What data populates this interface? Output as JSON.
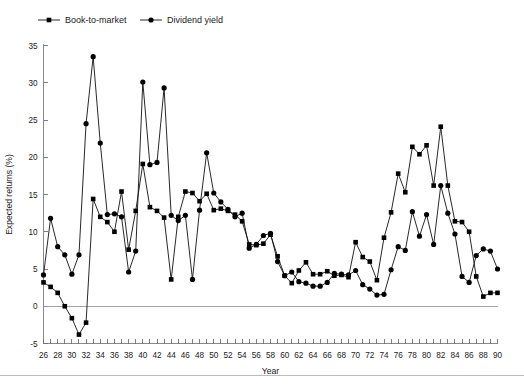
{
  "chart_data": {
    "type": "line",
    "title": "",
    "xlabel": "Year",
    "ylabel": "Expected returns (%)",
    "xlim": [
      26,
      90
    ],
    "ylim": [
      -5,
      35
    ],
    "grid": false,
    "legend_position": "top-left",
    "x_tick_step_major": 2,
    "x_tick_step_minor": 1,
    "y_tick_step": 5,
    "x_tick_labels": [
      "26",
      "28",
      "30",
      "32",
      "34",
      "36",
      "38",
      "40",
      "42",
      "44",
      "46",
      "48",
      "50",
      "52",
      "54",
      "56",
      "58",
      "60",
      "62",
      "64",
      "66",
      "68",
      "70",
      "72",
      "74",
      "76",
      "78",
      "80",
      "82",
      "84",
      "86",
      "88",
      "90"
    ],
    "y_tick_labels": [
      "-5",
      "0",
      "5",
      "10",
      "15",
      "20",
      "25",
      "30",
      "35"
    ],
    "x": [
      26,
      27,
      28,
      29,
      30,
      31,
      32,
      33,
      34,
      35,
      36,
      37,
      38,
      39,
      40,
      41,
      42,
      43,
      44,
      45,
      46,
      47,
      48,
      49,
      50,
      51,
      52,
      53,
      54,
      55,
      56,
      57,
      58,
      59,
      60,
      61,
      62,
      63,
      64,
      65,
      66,
      67,
      68,
      69,
      70,
      71,
      72,
      73,
      74,
      75,
      76,
      77,
      78,
      79,
      80,
      81,
      82,
      83,
      84,
      85,
      86,
      87,
      88,
      89,
      90
    ],
    "series": [
      {
        "name": "Book-to-market",
        "marker": "square",
        "color": "#000000",
        "values": [
          3.2,
          2.6,
          1.8,
          0.0,
          -1.6,
          -3.8,
          -2.2,
          14.4,
          12.0,
          11.3,
          10.0,
          15.4,
          7.6,
          12.8,
          19.1,
          13.3,
          12.8,
          11.9,
          3.6,
          12.0,
          15.4,
          15.2,
          14.1,
          15.1,
          12.9,
          13.1,
          12.8,
          12.3,
          11.4,
          8.3,
          8.2,
          8.4,
          9.6,
          6.7,
          4.1,
          3.1,
          4.8,
          5.9,
          4.3,
          4.3,
          4.7,
          4.1,
          4.2,
          3.9,
          8.6,
          6.6,
          6.0,
          3.5,
          9.2,
          12.6,
          17.8,
          15.3,
          21.4,
          20.4,
          21.6,
          16.2,
          24.1,
          16.2,
          11.4,
          11.3,
          10.0,
          4.0,
          1.3,
          1.8,
          1.8
        ]
      },
      {
        "name": "Dividend yield",
        "marker": "circle",
        "color": "#000000",
        "values": [
          4.2,
          11.8,
          8.0,
          6.9,
          4.3,
          6.9,
          24.5,
          33.5,
          21.9,
          12.3,
          12.4,
          12.0,
          4.6,
          7.4,
          30.1,
          19.0,
          19.3,
          29.3,
          12.2,
          11.5,
          12.2,
          3.6,
          12.9,
          20.6,
          15.2,
          14.0,
          13.0,
          12.0,
          12.5,
          7.8,
          8.3,
          9.5,
          9.8,
          6.0,
          4.1,
          4.6,
          3.3,
          3.1,
          2.7,
          2.7,
          3.2,
          4.4,
          4.3,
          4.2,
          4.8,
          2.9,
          2.3,
          1.5,
          1.6,
          4.9,
          8.0,
          7.5,
          12.7,
          9.4,
          12.3,
          8.3,
          16.2,
          12.5,
          9.7,
          4.0,
          3.2,
          6.8,
          7.7,
          7.4,
          5.0
        ]
      }
    ]
  },
  "legend": {
    "items": [
      {
        "label": "Book-to-market",
        "marker": "square"
      },
      {
        "label": "Dividend yield",
        "marker": "circle"
      }
    ]
  },
  "axes": {
    "y_title": "Expected returns (%)",
    "x_title": "Year"
  }
}
